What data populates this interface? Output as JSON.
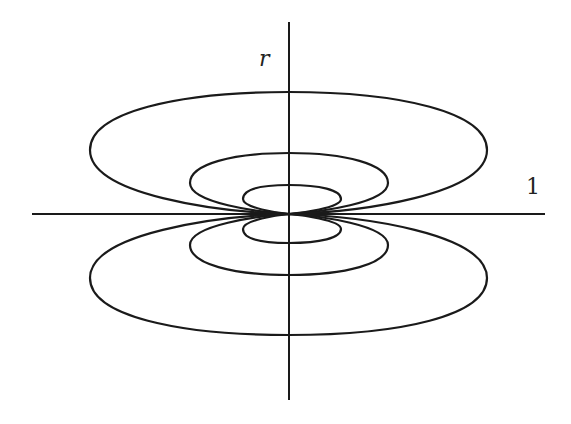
{
  "diagram": {
    "labels": {
      "vertical_axis": "r",
      "horizontal_axis": "1"
    },
    "origin": {
      "x": 289,
      "y": 214
    },
    "axes": {
      "horizontal": {
        "x1": 32,
        "x2": 545,
        "y": 214
      },
      "vertical": {
        "x": 289,
        "y1": 22,
        "y2": 400
      }
    },
    "loops": [
      {
        "name": "inner-upper",
        "half_width": 48,
        "height": 29
      },
      {
        "name": "middle-upper",
        "half_width": 99,
        "height": 61
      },
      {
        "name": "outer-upper",
        "half_width": 198,
        "height": 122
      },
      {
        "name": "inner-lower",
        "half_width": 52,
        "height": 29
      },
      {
        "name": "middle-lower",
        "half_width": 99,
        "height": 61
      },
      {
        "name": "outer-lower",
        "half_width": 198,
        "height": 121
      }
    ],
    "stroke_color": "#1a1a1a",
    "background": "#ffffff"
  }
}
